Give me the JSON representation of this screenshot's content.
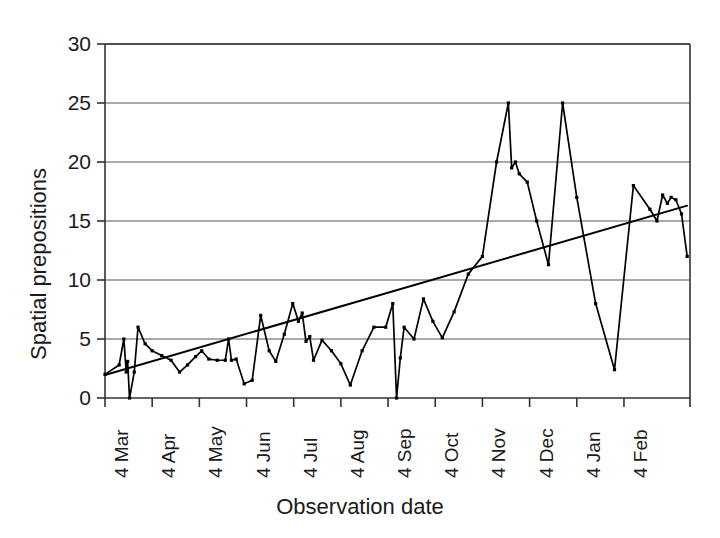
{
  "chart_data": {
    "type": "line",
    "title": "",
    "xlabel": "Observation date",
    "ylabel": "Spatial prepositions",
    "ylim": [
      0,
      30
    ],
    "yticks": [
      0,
      5,
      10,
      15,
      20,
      25,
      30
    ],
    "grid": "horizontal",
    "legend": "none",
    "xtick_labels": [
      "4 Mar",
      "4 Apr",
      "4 May",
      "4 Jun",
      "4 Jul",
      "4 Aug",
      "4 Sep",
      "4 Oct",
      "4 Nov",
      "4 Dec",
      "4 Jan",
      "4 Feb"
    ],
    "xlim": [
      0,
      12.4
    ],
    "series": [
      {
        "name": "Spatial prepositions",
        "style": "line-markers",
        "color": "#000000",
        "x": [
          0.0,
          0.3,
          0.4,
          0.45,
          0.48,
          0.52,
          0.62,
          0.7,
          0.85,
          1.0,
          1.2,
          1.4,
          1.58,
          1.75,
          1.92,
          2.05,
          2.2,
          2.38,
          2.55,
          2.62,
          2.68,
          2.78,
          2.95,
          3.12,
          3.3,
          3.48,
          3.62,
          3.8,
          3.98,
          4.1,
          4.18,
          4.26,
          4.34,
          4.42,
          4.6,
          4.8,
          5.0,
          5.2,
          5.45,
          5.7,
          5.95,
          6.1,
          6.18,
          6.26,
          6.34,
          6.55,
          6.75,
          6.95,
          7.15,
          7.4,
          7.7,
          8.0,
          8.3,
          8.55,
          8.62,
          8.7,
          8.78,
          8.95,
          9.15,
          9.4,
          9.7,
          10.0,
          10.4,
          10.8,
          11.2,
          11.55,
          11.7,
          11.82,
          11.92,
          12.0,
          12.1,
          12.22,
          12.34
        ],
        "y": [
          2.0,
          2.8,
          5.0,
          2.2,
          3.1,
          0.0,
          2.2,
          6.0,
          4.6,
          4.0,
          3.6,
          3.2,
          2.2,
          2.8,
          3.5,
          4.0,
          3.3,
          3.2,
          3.2,
          5.0,
          3.2,
          3.3,
          1.2,
          1.5,
          7.0,
          4.0,
          3.1,
          5.4,
          8.0,
          6.5,
          7.2,
          4.8,
          5.2,
          3.2,
          4.9,
          4.0,
          2.9,
          1.1,
          4.0,
          6.0,
          6.0,
          8.0,
          0.0,
          3.4,
          6.0,
          5.0,
          8.4,
          6.5,
          5.1,
          7.3,
          10.5,
          12.0,
          20.0,
          25.0,
          19.5,
          20.0,
          19.0,
          18.3,
          15.0,
          11.3,
          25.0,
          17.0,
          8.0,
          2.4,
          18.0,
          16.0,
          15.0,
          17.2,
          16.5,
          17.0,
          16.8,
          15.6,
          12.0
        ]
      },
      {
        "name": "Trend line",
        "style": "line",
        "color": "#000000",
        "x": [
          0.0,
          12.34
        ],
        "y": [
          1.95,
          16.3
        ]
      }
    ]
  },
  "axis": {
    "ylabel": "Spatial prepositions",
    "xlabel": "Observation date"
  }
}
